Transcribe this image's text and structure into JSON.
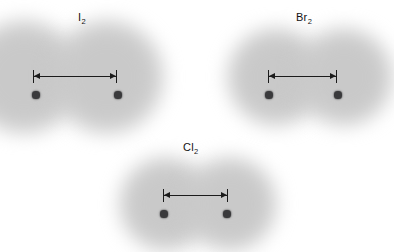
{
  "figure": {
    "type": "diagram",
    "background_color": "#ffffff",
    "cloud_color": "#c9c9c9",
    "atom_color": "#3a3a3c",
    "line_color": "#1b1b1b"
  },
  "molecules": [
    {
      "id": "iodine",
      "formula_symbol": "I",
      "formula_subscript": "2",
      "label": "I2",
      "label_x": 78,
      "label_y": 12,
      "cloud": {
        "left": -26,
        "top": 30,
        "width": 190,
        "height": 94,
        "lobe_radius": 58,
        "lobe1_cx": 50,
        "lobe2_cx": 133,
        "lobe_cy": 47
      },
      "atoms": [
        {
          "cx": 36,
          "cy": 95,
          "r": 3.6
        },
        {
          "cx": 118,
          "cy": 95,
          "r": 3.6
        }
      ],
      "measure": {
        "x1": 33,
        "x2": 117,
        "y": 76,
        "tick_height": 13,
        "length_px": 84
      }
    },
    {
      "id": "bromine",
      "formula_symbol": "Br",
      "formula_subscript": "2",
      "label": "Br2",
      "label_x": 296,
      "label_y": 12,
      "cloud": {
        "left": 232,
        "top": 33,
        "width": 148,
        "height": 88,
        "lobe_radius": 50,
        "lobe1_cx": 44,
        "lobe2_cx": 112,
        "lobe_cy": 44
      },
      "atoms": [
        {
          "cx": 269,
          "cy": 95,
          "r": 3.6
        },
        {
          "cx": 338,
          "cy": 95,
          "r": 3.6
        }
      ],
      "measure": {
        "x1": 268,
        "x2": 337,
        "y": 76,
        "tick_height": 13,
        "length_px": 69
      }
    },
    {
      "id": "chlorine",
      "formula_symbol": "Cl",
      "formula_subscript": "2",
      "label": "Cl2",
      "label_x": 183,
      "label_y": 142,
      "cloud": {
        "left": 124,
        "top": 160,
        "width": 142,
        "height": 86,
        "lobe_radius": 48,
        "lobe1_cx": 42,
        "lobe2_cx": 106,
        "lobe_cy": 44
      },
      "atoms": [
        {
          "cx": 164,
          "cy": 214,
          "r": 3.6
        },
        {
          "cx": 227,
          "cy": 214,
          "r": 3.6
        }
      ],
      "measure": {
        "x1": 163,
        "x2": 228,
        "y": 195,
        "tick_height": 13,
        "length_px": 65
      }
    }
  ]
}
